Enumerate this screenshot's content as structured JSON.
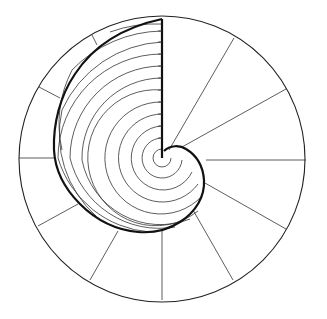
{
  "diagram": {
    "outer_circle": {
      "cx": 162,
      "cy": 159,
      "r": 143
    },
    "center": {
      "x": 162,
      "y": 158
    },
    "colors": {
      "line": "#222222",
      "background": "#ffffff"
    },
    "radial_lines": [
      {
        "angle_deg": 60,
        "x1": 169,
        "y1": 150,
        "x2": 234,
        "y2": 38
      },
      {
        "angle_deg": 30,
        "x1": 182,
        "y1": 147,
        "x2": 286,
        "y2": 89
      },
      {
        "angle_deg": 0,
        "x1": 206,
        "y1": 160,
        "x2": 306,
        "y2": 160
      },
      {
        "angle_deg": -30,
        "x1": 205,
        "y1": 183,
        "x2": 286,
        "y2": 229
      },
      {
        "angle_deg": -60,
        "x1": 193,
        "y1": 210,
        "x2": 233,
        "y2": 280
      },
      {
        "angle_deg": -90,
        "x1": 162,
        "y1": 229,
        "x2": 162,
        "y2": 300
      },
      {
        "angle_deg": -120,
        "x1": 118,
        "y1": 231,
        "x2": 90,
        "y2": 280
      },
      {
        "angle_deg": -150,
        "x1": 78,
        "y1": 204,
        "x2": 38,
        "y2": 226
      },
      {
        "angle_deg": 180,
        "x1": 54,
        "y1": 158,
        "x2": 19,
        "y2": 158
      },
      {
        "angle_deg": 150,
        "x1": 60,
        "y1": 98,
        "x2": 39,
        "y2": 87
      },
      {
        "angle_deg": 120,
        "x1": 97,
        "y1": 45,
        "x2": 92,
        "y2": 35
      }
    ],
    "axis_line": {
      "x1": 162,
      "y1": 158,
      "x2": 162,
      "y2": 19
    },
    "concentric_arc_count": 12
  }
}
